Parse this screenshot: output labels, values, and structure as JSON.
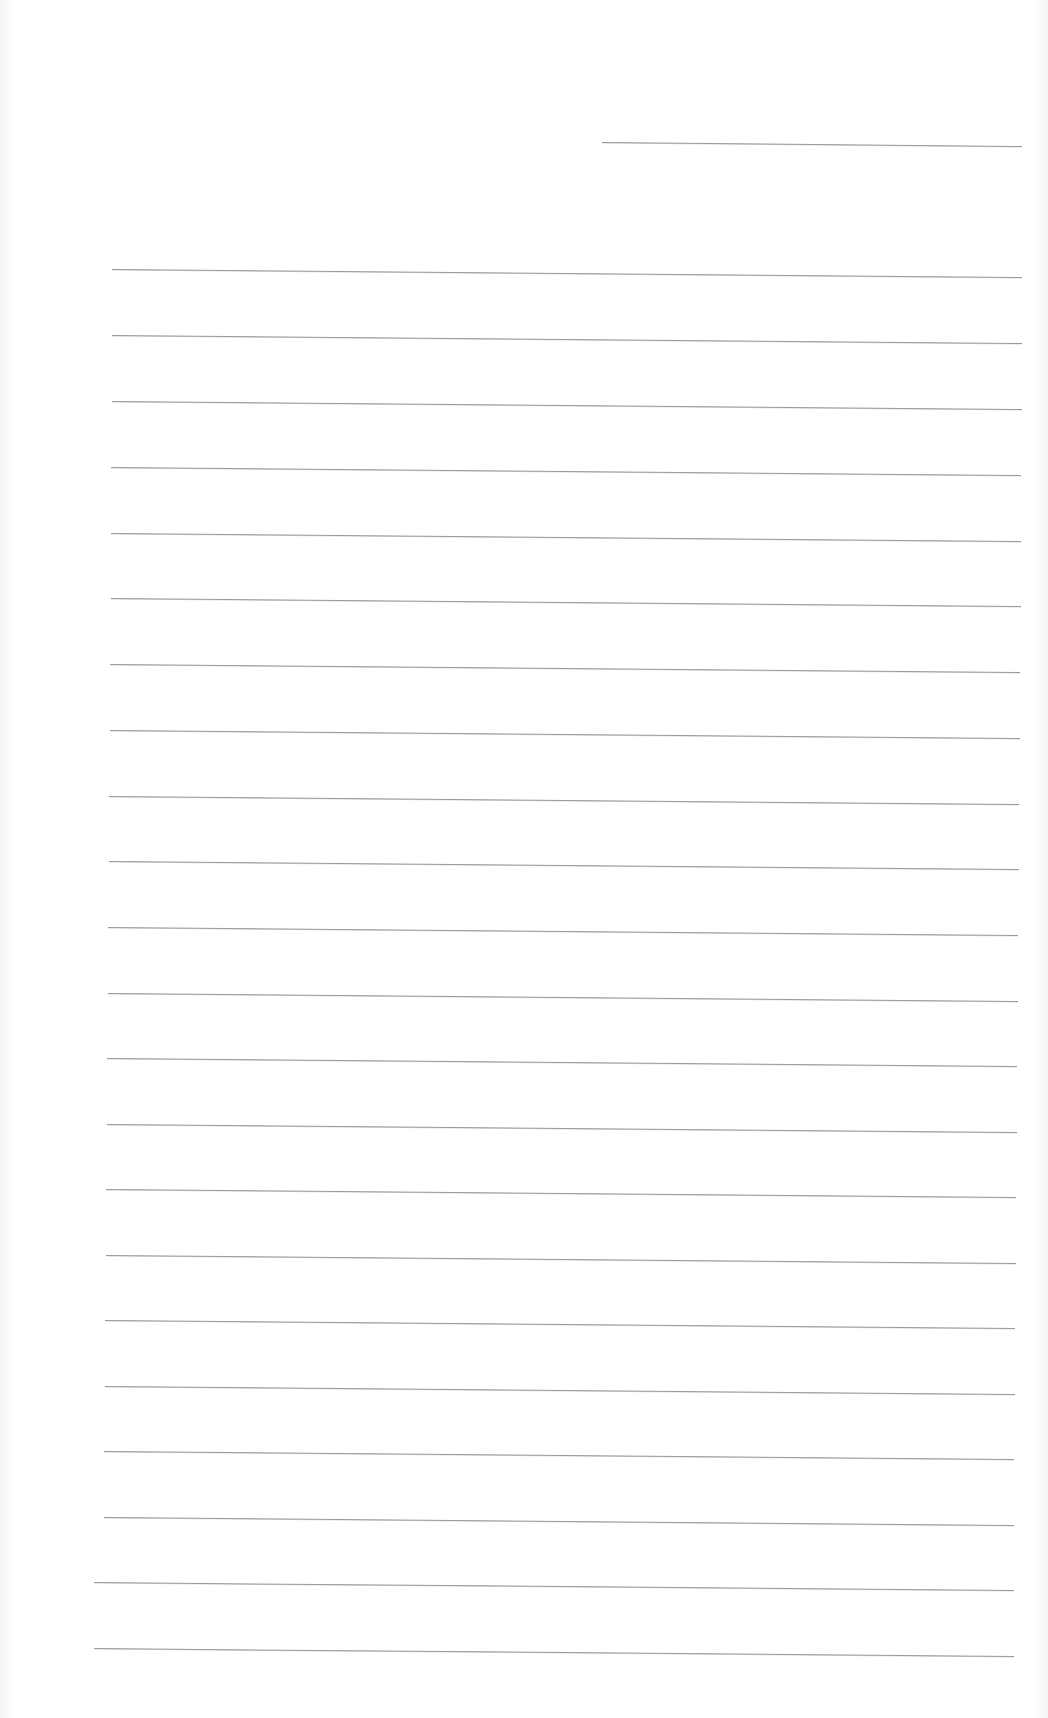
{
  "page": {
    "type": "lined-paper",
    "background_color": "#ffffff",
    "line_color": "#9a9a9a",
    "short_line": {
      "x1": 602,
      "y1": 142,
      "x2": 1022,
      "y2": 146
    },
    "lines": [
      {
        "x1": 112,
        "y1": 269,
        "x2": 1022,
        "y2": 277
      },
      {
        "x1": 112,
        "y1": 335,
        "x2": 1022,
        "y2": 343
      },
      {
        "x1": 112,
        "y1": 401,
        "x2": 1022,
        "y2": 409
      },
      {
        "x1": 111,
        "y1": 467,
        "x2": 1021,
        "y2": 475
      },
      {
        "x1": 111,
        "y1": 533,
        "x2": 1021,
        "y2": 541
      },
      {
        "x1": 111,
        "y1": 598,
        "x2": 1021,
        "y2": 606
      },
      {
        "x1": 110,
        "y1": 664,
        "x2": 1020,
        "y2": 672
      },
      {
        "x1": 110,
        "y1": 730,
        "x2": 1020,
        "y2": 738
      },
      {
        "x1": 109,
        "y1": 796,
        "x2": 1019,
        "y2": 804
      },
      {
        "x1": 109,
        "y1": 861,
        "x2": 1019,
        "y2": 869
      },
      {
        "x1": 108,
        "y1": 927,
        "x2": 1018,
        "y2": 935
      },
      {
        "x1": 108,
        "y1": 993,
        "x2": 1018,
        "y2": 1001
      },
      {
        "x1": 107,
        "y1": 1058,
        "x2": 1017,
        "y2": 1066
      },
      {
        "x1": 107,
        "y1": 1124,
        "x2": 1017,
        "y2": 1132
      },
      {
        "x1": 106,
        "y1": 1189,
        "x2": 1016,
        "y2": 1197
      },
      {
        "x1": 106,
        "y1": 1255,
        "x2": 1016,
        "y2": 1263
      },
      {
        "x1": 105,
        "y1": 1320,
        "x2": 1015,
        "y2": 1328
      },
      {
        "x1": 105,
        "y1": 1386,
        "x2": 1015,
        "y2": 1394
      },
      {
        "x1": 104,
        "y1": 1451,
        "x2": 1014,
        "y2": 1459
      },
      {
        "x1": 104,
        "y1": 1517,
        "x2": 1014,
        "y2": 1525
      },
      {
        "x1": 94,
        "y1": 1582,
        "x2": 1014,
        "y2": 1590
      },
      {
        "x1": 94,
        "y1": 1648,
        "x2": 1014,
        "y2": 1656
      }
    ]
  }
}
